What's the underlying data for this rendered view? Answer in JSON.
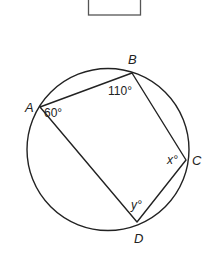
{
  "diagram": {
    "type": "cyclic-quadrilateral",
    "answer_box": {
      "visible": true
    },
    "circle": {
      "cx": 108,
      "cy": 149.5,
      "r": 81
    },
    "points": {
      "A": {
        "label": "A",
        "x": 40,
        "y": 107
      },
      "B": {
        "label": "B",
        "x": 132,
        "y": 73
      },
      "C": {
        "label": "C",
        "x": 186,
        "y": 160
      },
      "D": {
        "label": "D",
        "x": 137,
        "y": 222
      }
    },
    "angles": {
      "A": {
        "text": "60°",
        "value": 60
      },
      "B": {
        "text": "110°",
        "value": 110
      },
      "C": {
        "text": "x°",
        "variable": "x"
      },
      "D": {
        "text": "y°",
        "variable": "y"
      }
    },
    "stroke_color": "#222222",
    "box_color": "#555555"
  }
}
